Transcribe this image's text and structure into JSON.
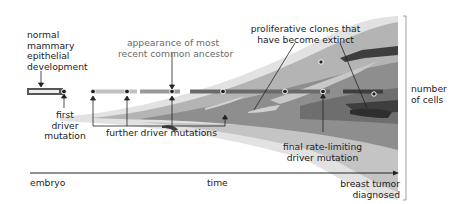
{
  "diagram": {
    "labels": {
      "normal_development": [
        "normal",
        "mammary",
        "epithelial",
        "development"
      ],
      "first_driver": [
        "first",
        "driver",
        "mutation"
      ],
      "further_drivers": "further driver mutations",
      "mrca": [
        "appearance of most",
        "recent common ancestor"
      ],
      "extinct_clones": [
        "proliferative clones that",
        "have become extinct"
      ],
      "final_driver": [
        "final rate-limiting",
        "driver mutation"
      ],
      "y_axis": [
        "number",
        "of cells"
      ],
      "x_start": "embryo",
      "x_mid": "time",
      "x_end": [
        "breast tumor",
        "diagnosed"
      ]
    },
    "colors": {
      "lightest": "#e4e4e4",
      "light": "#cfcfcf",
      "mid": "#a9a9a9",
      "mid_dark": "#8c8c8c",
      "dark": "#6a6a6a",
      "darkest": "#3c3c3c",
      "text": "#222222",
      "text_gray": "#6a6a6a"
    },
    "mutation_points_count": 9
  }
}
